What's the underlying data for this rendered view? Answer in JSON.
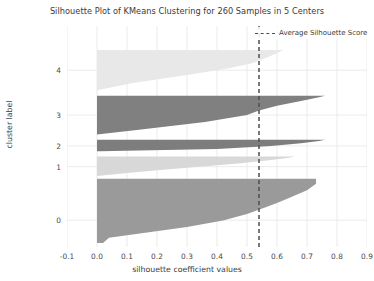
{
  "chart_data": {
    "type": "area",
    "title": "Silhouette Plot of KMeans Clustering for 260 Samples in 5 Centers",
    "xlabel": "silhouette coefficient values",
    "ylabel": "cluster label",
    "xlim": [
      -0.1,
      0.9
    ],
    "ylim": [
      0,
      330
    ],
    "grid": true,
    "legend_position": "top-right",
    "legend": [
      {
        "label": "Average Silhouette Score",
        "style": "dashed-line",
        "color": "#4d4d4d"
      }
    ],
    "average_silhouette_score": 0.54,
    "n_samples": 260,
    "n_clusters": 5,
    "xticks": [
      "-0.1",
      "0.0",
      "0.1",
      "0.2",
      "0.3",
      "0.4",
      "0.5",
      "0.6",
      "0.7",
      "0.8",
      "0.9"
    ],
    "xtick_values": [
      -0.1,
      0.0,
      0.1,
      0.2,
      0.3,
      0.4,
      0.5,
      0.6,
      0.7,
      0.8,
      0.9
    ],
    "yticks": [
      "0",
      "1",
      "2",
      "3",
      "4"
    ],
    "ytick_values": [
      0,
      1,
      2,
      3,
      4
    ],
    "clusters": [
      {
        "label": "0",
        "color": "#9a9a9a",
        "size": 96,
        "y_center": 40,
        "y_start": 6,
        "y_end": 102,
        "silhouette_min": 0.02,
        "silhouette_max": 0.73,
        "profile": [
          [
            0.02,
            0.0
          ],
          [
            0.04,
            0.08
          ],
          [
            0.3,
            0.25
          ],
          [
            0.42,
            0.35
          ],
          [
            0.5,
            0.45
          ],
          [
            0.56,
            0.55
          ],
          [
            0.6,
            0.62
          ],
          [
            0.64,
            0.7
          ],
          [
            0.7,
            0.82
          ],
          [
            0.73,
            0.92
          ],
          [
            0.73,
            1.0
          ]
        ]
      },
      {
        "label": "1",
        "color": "#d8d8d8",
        "size": 29,
        "y_center": 120,
        "y_start": 106,
        "y_end": 135,
        "silhouette_min": 0.0,
        "silhouette_max": 0.66,
        "profile": [
          [
            0.0,
            0.0
          ],
          [
            0.1,
            0.15
          ],
          [
            0.22,
            0.32
          ],
          [
            0.36,
            0.5
          ],
          [
            0.48,
            0.66
          ],
          [
            0.58,
            0.82
          ],
          [
            0.64,
            0.94
          ],
          [
            0.66,
            1.0
          ]
        ]
      },
      {
        "label": "2",
        "color": "#7d7d7d",
        "size": 17,
        "y_center": 151,
        "y_start": 143,
        "y_end": 160,
        "silhouette_min": 0.01,
        "silhouette_max": 0.76,
        "profile": [
          [
            0.01,
            0.0
          ],
          [
            0.4,
            0.2
          ],
          [
            0.58,
            0.45
          ],
          [
            0.68,
            0.7
          ],
          [
            0.74,
            0.9
          ],
          [
            0.76,
            1.0
          ]
        ]
      },
      {
        "label": "3",
        "color": "#808080",
        "size": 58,
        "y_center": 197,
        "y_start": 168,
        "y_end": 226,
        "silhouette_min": 0.0,
        "silhouette_max": 0.76,
        "profile": [
          [
            0.0,
            0.0
          ],
          [
            0.14,
            0.12
          ],
          [
            0.36,
            0.32
          ],
          [
            0.5,
            0.5
          ],
          [
            0.54,
            0.62
          ],
          [
            0.6,
            0.74
          ],
          [
            0.68,
            0.86
          ],
          [
            0.74,
            0.96
          ],
          [
            0.76,
            1.0
          ]
        ]
      },
      {
        "label": "4",
        "color": "#e8e8e8",
        "size": 60,
        "y_center": 264,
        "y_start": 234,
        "y_end": 294,
        "silhouette_min": 0.0,
        "silhouette_max": 0.62,
        "profile": [
          [
            0.0,
            0.0
          ],
          [
            0.12,
            0.18
          ],
          [
            0.3,
            0.38
          ],
          [
            0.44,
            0.55
          ],
          [
            0.52,
            0.68
          ],
          [
            0.56,
            0.8
          ],
          [
            0.6,
            0.92
          ],
          [
            0.62,
            1.0
          ]
        ]
      }
    ]
  }
}
